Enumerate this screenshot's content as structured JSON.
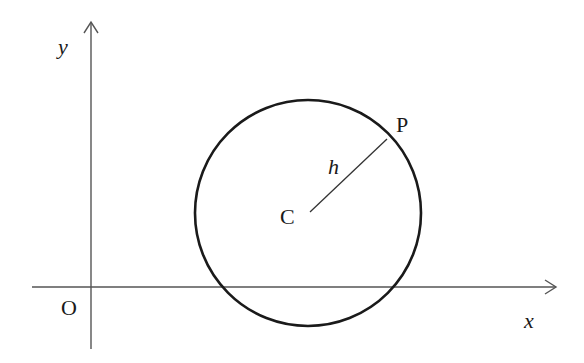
{
  "diagram": {
    "type": "coordinate-geometry",
    "axes": {
      "x_label": "x",
      "y_label": "y",
      "origin_label": "O"
    },
    "circle": {
      "center_label": "C",
      "point_label": "P",
      "radius_label": "h"
    },
    "colors": {
      "axis": "#555555",
      "circle": "#1a1a1a",
      "radius": "#333333",
      "text": "#1a1a1a",
      "background": "#ffffff"
    }
  }
}
